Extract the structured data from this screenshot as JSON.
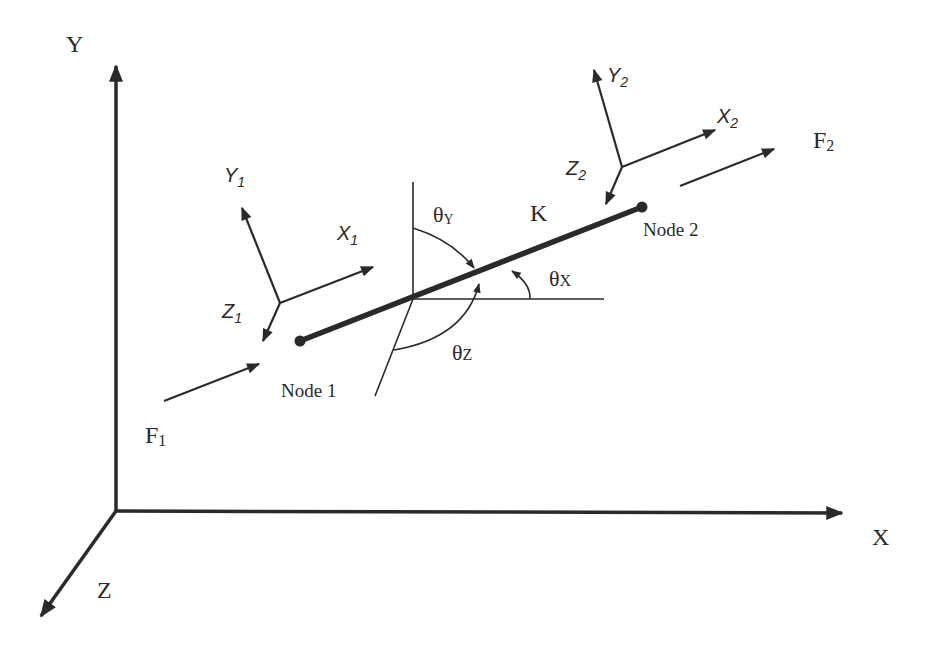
{
  "diagram": {
    "type": "spring-element-coordinate-systems",
    "global_axes": {
      "x_label": "X",
      "y_label": "Y",
      "z_label": "Z"
    },
    "local_frame_1": {
      "x_label": "X",
      "x_sub": "1",
      "y_label": "Y",
      "y_sub": "1",
      "z_label": "Z",
      "z_sub": "1"
    },
    "local_frame_2": {
      "x_label": "X",
      "x_sub": "2",
      "y_label": "Y",
      "y_sub": "2",
      "z_label": "Z",
      "z_sub": "2"
    },
    "element": {
      "stiffness_label": "K",
      "node1_label": "Node 1",
      "node2_label": "Node 2"
    },
    "forces": {
      "f1_label": "F",
      "f1_sub": "1",
      "f2_label": "F",
      "f2_sub": "2"
    },
    "angles": {
      "theta_x": "θ",
      "theta_x_sub": "X",
      "theta_y": "θ",
      "theta_y_sub": "Y",
      "theta_z": "θ",
      "theta_z_sub": "Z"
    },
    "colors": {
      "ink": "#2a2a2a",
      "background": "#ffffff"
    }
  }
}
